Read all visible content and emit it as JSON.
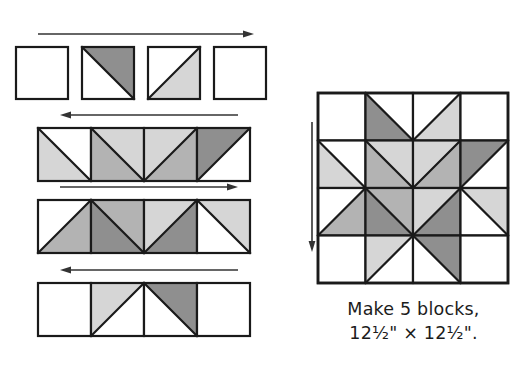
{
  "figure": {
    "kind": "quilt-block-assembly-diagram",
    "caption_line1": "Make 5 blocks,",
    "caption_line2": "12½\" × 12½\".",
    "background": "#ffffff",
    "outline_color": "#1a1a1a"
  },
  "palette": {
    "white": "#ffffff",
    "light_gray": "#d6d6d6",
    "medium_gray": "#b3b3b3",
    "dark_gray": "#8f8f8f",
    "line": "#1a1a1a",
    "arrow": "#333333",
    "text": "#1c1c1c"
  },
  "legend": {
    "white_label": "white",
    "light_label": "light gray",
    "medium_label": "medium gray",
    "dark_label": "dark gray"
  },
  "rows": [
    {
      "name": "row-1",
      "arrow_direction": "right",
      "arrow_label": "press seams to the right",
      "cells": [
        {
          "fill": "none",
          "diagonal": "none",
          "first": "white",
          "second": "white"
        },
        {
          "fill": "half",
          "diagonal": "tl-br",
          "first": "white",
          "second": "dark_gray"
        },
        {
          "fill": "half",
          "diagonal": "bl-tr",
          "first": "white",
          "second": "light_gray"
        },
        {
          "fill": "none",
          "diagonal": "none",
          "first": "white",
          "second": "white"
        }
      ]
    },
    {
      "name": "row-2",
      "arrow_direction": "left",
      "arrow_label": "press seams to the left",
      "cells": [
        {
          "fill": "half",
          "diagonal": "tl-br",
          "first": "light_gray",
          "second": "white"
        },
        {
          "fill": "half",
          "diagonal": "tl-br",
          "first": "medium_gray",
          "second": "light_gray"
        },
        {
          "fill": "half",
          "diagonal": "bl-tr",
          "first": "light_gray",
          "second": "medium_gray"
        },
        {
          "fill": "half",
          "diagonal": "bl-tr",
          "first": "dark_gray",
          "second": "white"
        }
      ]
    },
    {
      "name": "row-3",
      "arrow_direction": "right",
      "arrow_label": "press seams to the right",
      "cells": [
        {
          "fill": "half",
          "diagonal": "bl-tr",
          "first": "white",
          "second": "medium_gray"
        },
        {
          "fill": "half",
          "diagonal": "tl-br",
          "first": "dark_gray",
          "second": "medium_gray"
        },
        {
          "fill": "half",
          "diagonal": "bl-tr",
          "first": "light_gray",
          "second": "dark_gray"
        },
        {
          "fill": "half",
          "diagonal": "tl-br",
          "first": "white",
          "second": "light_gray"
        }
      ]
    },
    {
      "name": "row-4",
      "arrow_direction": "left",
      "arrow_label": "press seams to the left",
      "cells": [
        {
          "fill": "none",
          "diagonal": "none",
          "first": "white",
          "second": "white"
        },
        {
          "fill": "half",
          "diagonal": "bl-tr",
          "first": "light_gray",
          "second": "white"
        },
        {
          "fill": "half",
          "diagonal": "tl-br",
          "first": "white",
          "second": "dark_gray"
        },
        {
          "fill": "none",
          "diagonal": "none",
          "first": "white",
          "second": "white"
        }
      ]
    }
  ],
  "block": {
    "name": "finished-star-block",
    "grid": "4x4",
    "arrow_direction": "down",
    "arrow_label": "press seams down",
    "cells": [
      {
        "r": 0,
        "c": 0,
        "diagonal": "none",
        "first": "white",
        "second": "white"
      },
      {
        "r": 0,
        "c": 1,
        "diagonal": "tl-br",
        "first": "dark_gray",
        "second": "white"
      },
      {
        "r": 0,
        "c": 2,
        "diagonal": "bl-tr",
        "first": "white",
        "second": "light_gray"
      },
      {
        "r": 0,
        "c": 3,
        "diagonal": "none",
        "first": "white",
        "second": "white"
      },
      {
        "r": 1,
        "c": 0,
        "diagonal": "tl-br",
        "first": "light_gray",
        "second": "white"
      },
      {
        "r": 1,
        "c": 1,
        "diagonal": "tl-br",
        "first": "medium_gray",
        "second": "light_gray"
      },
      {
        "r": 1,
        "c": 2,
        "diagonal": "bl-tr",
        "first": "light_gray",
        "second": "medium_gray"
      },
      {
        "r": 1,
        "c": 3,
        "diagonal": "bl-tr",
        "first": "dark_gray",
        "second": "white"
      },
      {
        "r": 2,
        "c": 0,
        "diagonal": "bl-tr",
        "first": "white",
        "second": "medium_gray"
      },
      {
        "r": 2,
        "c": 1,
        "diagonal": "tl-br",
        "first": "dark_gray",
        "second": "medium_gray"
      },
      {
        "r": 2,
        "c": 2,
        "diagonal": "bl-tr",
        "first": "light_gray",
        "second": "dark_gray"
      },
      {
        "r": 2,
        "c": 3,
        "diagonal": "tl-br",
        "first": "white",
        "second": "light_gray"
      },
      {
        "r": 3,
        "c": 0,
        "diagonal": "none",
        "first": "white",
        "second": "white"
      },
      {
        "r": 3,
        "c": 1,
        "diagonal": "bl-tr",
        "first": "light_gray",
        "second": "white"
      },
      {
        "r": 3,
        "c": 2,
        "diagonal": "tl-br",
        "first": "white",
        "second": "dark_gray"
      },
      {
        "r": 3,
        "c": 3,
        "diagonal": "none",
        "first": "white",
        "second": "white"
      }
    ]
  }
}
